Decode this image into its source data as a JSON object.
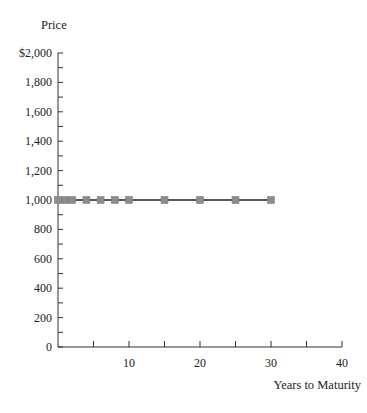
{
  "chart_data": {
    "type": "line",
    "title": "",
    "xlabel": "Years to Maturity",
    "ylabel": "Price",
    "xlim": [
      0,
      40
    ],
    "ylim": [
      0,
      2000
    ],
    "x_ticks": [
      10,
      20,
      30,
      40
    ],
    "x_tick_labels": [
      "10",
      "20",
      "30",
      "40"
    ],
    "x_minor_ticks": [
      5,
      10,
      15,
      20,
      25,
      30,
      35,
      40
    ],
    "y_ticks": [
      0,
      200,
      400,
      600,
      800,
      1000,
      1200,
      1400,
      1600,
      1800,
      2000
    ],
    "y_tick_labels": [
      "0",
      "200",
      "400",
      "600",
      "800",
      "1,000",
      "1,200",
      "1,400",
      "1,600",
      "1,800",
      "$2,000"
    ],
    "grid": false,
    "legend": null,
    "series": [
      {
        "name": "Bond price",
        "marker": "square",
        "color": "#8c8c8c",
        "line_color": "#222222",
        "x": [
          0,
          1,
          2,
          4,
          6,
          8,
          10,
          15,
          20,
          25,
          30
        ],
        "y": [
          1000,
          1000,
          1000,
          1000,
          1000,
          1000,
          1000,
          1000,
          1000,
          1000,
          1000
        ]
      }
    ]
  }
}
